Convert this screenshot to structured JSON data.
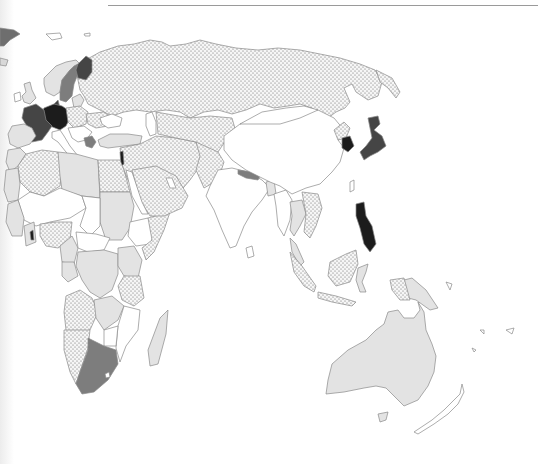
{
  "map": {
    "type": "choropleth",
    "region": "Eastern Hemisphere (Europe, Africa, Asia, Oceania)",
    "style": "grayscale print",
    "legend_visible": false,
    "title": "",
    "colors": {
      "background": "#ffffff",
      "border": "#8a8a8a",
      "category_black": "#1c1c1c",
      "category_dark": "#454545",
      "category_medium": "#7d7d7d",
      "category_light": "#e3e3e3",
      "category_dotted": "#f4f4f4",
      "dot": "#6a6a6a",
      "no_data": "#ffffff"
    },
    "categories": [
      {
        "id": "black",
        "countries": [
          "Germany",
          "South Korea",
          "Philippines",
          "Israel",
          "Ghana"
        ]
      },
      {
        "id": "dark",
        "countries": [
          "France",
          "Finland",
          "Japan"
        ]
      },
      {
        "id": "medium",
        "countries": [
          "Sweden",
          "Greece",
          "Nepal",
          "South Africa"
        ]
      },
      {
        "id": "light",
        "countries": [
          "Spain",
          "Ireland",
          "Libya",
          "Sudan",
          "Turkey",
          "Thailand",
          "Bangladesh",
          "DR Congo",
          "Zambia",
          "Kenya",
          "Madagascar",
          "Australia",
          "Malaysia",
          "Papua New Guinea"
        ]
      },
      {
        "id": "dotted",
        "countries": [
          "Russia",
          "Kazakhstan",
          "Iran",
          "Saudi Arabia",
          "Egypt",
          "Algeria",
          "Nigeria",
          "Ethiopia",
          "Somalia",
          "Tanzania",
          "Angola",
          "Namibia",
          "Vietnam",
          "Indonesia",
          "Borneo",
          "Central Asia"
        ]
      },
      {
        "id": "no_data",
        "countries": [
          "China",
          "India",
          "Mongolia",
          "Mali",
          "Niger",
          "Chad",
          "Mozambique",
          "Myanmar",
          "New Zealand"
        ]
      }
    ]
  }
}
